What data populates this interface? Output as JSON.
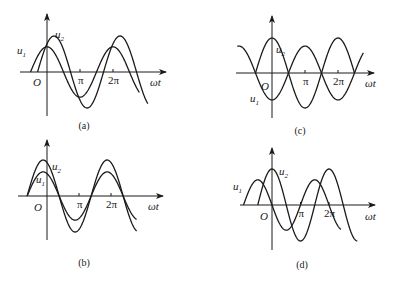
{
  "chart_data": [
    {
      "type": "line",
      "id": "a",
      "caption": "(a)",
      "xlabel": "ωt",
      "origin_label": "O",
      "x_ticks": [
        "π",
        "2π"
      ],
      "series": [
        {
          "name": "u1",
          "label": "u",
          "sub": "1",
          "amplitude": 0.7,
          "phase_rad": 1.5708,
          "form": "A·sin(ωt+φ)",
          "x_start_rad": -1.57,
          "x_end_rad": 8.8
        },
        {
          "name": "u2",
          "label": "u",
          "sub": "2",
          "amplitude": 1.0,
          "phase_rad": 0.9,
          "form": "A·sin(ωt+φ)",
          "x_start_rad": -0.9,
          "x_end_rad": 9.6
        }
      ],
      "note": "u2 larger amplitude, lags u1"
    },
    {
      "type": "line",
      "id": "b",
      "caption": "(b)",
      "xlabel": "ωt",
      "origin_label": "O",
      "x_ticks": [
        "π",
        "2π"
      ],
      "series": [
        {
          "name": "u1",
          "label": "u",
          "sub": "1",
          "amplitude": 0.67,
          "phase_rad": 1.95,
          "form": "A·sin(ωt+φ)",
          "x_start_rad": -1.95,
          "x_end_rad": 8.8
        },
        {
          "name": "u2",
          "label": "u",
          "sub": "2",
          "amplitude": 1.0,
          "phase_rad": 1.95,
          "form": "A·sin(ωt+φ)",
          "x_start_rad": -1.95,
          "x_end_rad": 8.8
        }
      ],
      "note": "u1 and u2 in phase"
    },
    {
      "type": "line",
      "id": "c",
      "caption": "(c)",
      "xlabel": "ωt",
      "origin_label": "O",
      "x_ticks": [
        "π",
        "2π"
      ],
      "series": [
        {
          "name": "u1",
          "label": "u",
          "sub": "1",
          "amplitude": 0.77,
          "phase_rad": -1.5708,
          "form": "A·sin(ωt+φ)",
          "x_start_rad": -3.3,
          "x_end_rad": 8.7
        },
        {
          "name": "u2",
          "label": "u",
          "sub": "2",
          "amplitude": 1.0,
          "phase_rad": 1.5708,
          "form": "A·sin(ωt+φ)",
          "x_start_rad": -1.57,
          "x_end_rad": 7.85
        }
      ],
      "note": "u1 and u2 in antiphase"
    },
    {
      "type": "line",
      "id": "d",
      "caption": "(d)",
      "xlabel": "ωt",
      "origin_label": "O",
      "x_ticks": [
        "π",
        "2π"
      ],
      "series": [
        {
          "name": "u1",
          "label": "u",
          "sub": "1",
          "amplitude": 0.7,
          "phase_rad": 3.14159,
          "form": "A·sin(ωt+φ)",
          "x_start_rad": -3.14,
          "x_end_rad": 7.6
        },
        {
          "name": "u2",
          "label": "u",
          "sub": "2",
          "amplitude": 1.0,
          "phase_rad": 1.5708,
          "form": "A·sin(ωt+φ)",
          "x_start_rad": -1.57,
          "x_end_rad": 9.4
        }
      ],
      "note": "u1 leads u2 by π/2"
    }
  ],
  "layout": {
    "a": {
      "ox": 47,
      "oy": 72,
      "pi_px": 33,
      "amp_px": 36,
      "x_axis": [
        20,
        166
      ],
      "y_axis": [
        14,
        116
      ],
      "xlabel_pos": [
        150,
        86
      ],
      "caption_pos": [
        84,
        129
      ],
      "u1_pos": [
        17,
        54
      ],
      "u2_pos": [
        55,
        38
      ],
      "origin_pos": [
        33,
        86
      ]
    },
    "b": {
      "ox": 47,
      "oy": 196,
      "pi_px": 32,
      "amp_px": 36,
      "x_axis": [
        18,
        163
      ],
      "y_axis": [
        140,
        240
      ],
      "xlabel_pos": [
        148,
        210
      ],
      "caption_pos": [
        84,
        266
      ],
      "u1_pos": [
        36,
        183
      ],
      "u2_pos": [
        52,
        170
      ],
      "origin_pos": [
        34,
        211
      ]
    },
    "c": {
      "ox": 272,
      "oy": 73,
      "pi_px": 33,
      "amp_px": 35,
      "x_axis": [
        236,
        374
      ],
      "y_axis": [
        16,
        118
      ],
      "xlabel_pos": [
        365,
        87
      ],
      "caption_pos": [
        300,
        134
      ],
      "u1_pos": [
        250,
        102
      ],
      "u2_pos": [
        276,
        53
      ],
      "origin_pos": [
        261,
        90
      ]
    },
    "d": {
      "ox": 272,
      "oy": 205,
      "pi_px": 28.5,
      "amp_px": 36,
      "x_axis": [
        240,
        375
      ],
      "y_axis": [
        148,
        250
      ],
      "xlabel_pos": [
        365,
        220
      ],
      "caption_pos": [
        302,
        268
      ],
      "u1_pos": [
        233,
        190
      ],
      "u2_pos": [
        279,
        175
      ],
      "origin_pos": [
        260,
        220
      ]
    }
  }
}
